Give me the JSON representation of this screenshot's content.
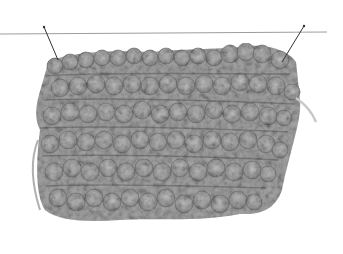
{
  "image": {
    "description": "Grey textured crocheted/knitted loop-stitch swatch hanging from a horizontal line by two pins",
    "colors": {
      "background": "#ffffff",
      "yarn_light": "#b8b8b8",
      "yarn_mid": "#9a9a9a",
      "yarn_dark": "#6e6e6e",
      "line": "#9c9c9c",
      "pin": "#333333"
    }
  }
}
